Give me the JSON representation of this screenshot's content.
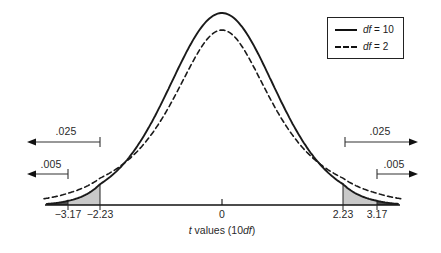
{
  "figure": {
    "background": "#ffffff",
    "description_labels": {
      "p025": ".025",
      "p005": ".005"
    }
  },
  "legend": {
    "items": [
      {
        "style": "solid",
        "prefix": "df",
        "suffix": " = 10",
        "df": 10
      },
      {
        "style": "dashed",
        "prefix": "df",
        "suffix": " = 2",
        "df": 2
      }
    ]
  },
  "chart_data": {
    "type": "line",
    "title": "",
    "xlabel": "t values (10df)",
    "xlabel_parts": {
      "t": "t",
      "mid": " values (10",
      "df": "df",
      "end": ")"
    },
    "x_tick_values": [
      -3.17,
      -2.23,
      0,
      2.23,
      3.17
    ],
    "tick_labels": [
      "−3.17",
      "−2.23",
      "0",
      "2.23",
      "3.17"
    ],
    "series": [
      {
        "name": "df = 10",
        "df": 10,
        "line_style": "solid"
      },
      {
        "name": "df = 2",
        "df": 2,
        "line_style": "dashed"
      }
    ],
    "critical_values": {
      "p025_two_tailed": 2.23,
      "p005_two_tailed": 3.17
    },
    "tail_annotations": [
      {
        "label": ".025",
        "t_abs": 2.23,
        "side": "both"
      },
      {
        "label": ".005",
        "t_abs": 3.17,
        "side": "both"
      }
    ],
    "shaded_regions": [
      {
        "from": -3.95,
        "to": -3.17,
        "color": "#4f4f4f",
        "meaning": "p005 tail"
      },
      {
        "from": -3.17,
        "to": -2.23,
        "color": "#c9c9c9",
        "meaning": "p025 tail"
      },
      {
        "from": 2.23,
        "to": 3.17,
        "color": "#c9c9c9",
        "meaning": "p025 tail"
      },
      {
        "from": 3.17,
        "to": 3.95,
        "color": "#4f4f4f",
        "meaning": "p005 tail"
      }
    ],
    "colors": {
      "curve": "#1a1a1a",
      "light_shade": "#c9c9c9",
      "dark_shade": "#4f4f4f",
      "arrow": "#333333"
    },
    "legend_position": "top-right",
    "grid": false
  }
}
